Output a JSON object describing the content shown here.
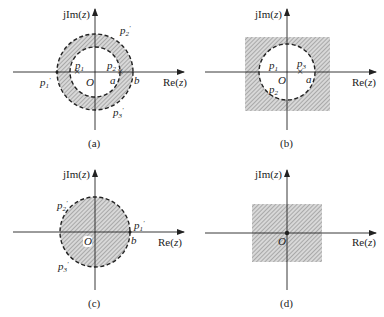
{
  "axes": {
    "imag_label": "jIm(z)",
    "real_label": "Re(z)",
    "origin_label": "O"
  },
  "colors": {
    "ink": "#222222",
    "hatch": "#8a8a8a",
    "background": "#ffffff"
  },
  "panels": [
    {
      "caption": "(a)",
      "region": "annulus a < |z| < b",
      "labels": {
        "p1": "p1",
        "p2": "p2",
        "p1p": "p1′",
        "p2p": "p2′",
        "p3p": "p3′",
        "a": "a",
        "b": "b"
      }
    },
    {
      "caption": "(b)",
      "region": "|z| > a (exterior of circle)",
      "labels": {
        "p1": "p1",
        "p2": "p2",
        "p3": "p3",
        "a": "a"
      }
    },
    {
      "caption": "(c)",
      "region": "|z| < b (interior of circle)",
      "labels": {
        "p1p": "p1′",
        "p2p": "p2′",
        "p3p": "p3′",
        "b": "b"
      }
    },
    {
      "caption": "(d)",
      "region": "entire z-plane (except possibly origin)",
      "labels": {}
    }
  ]
}
